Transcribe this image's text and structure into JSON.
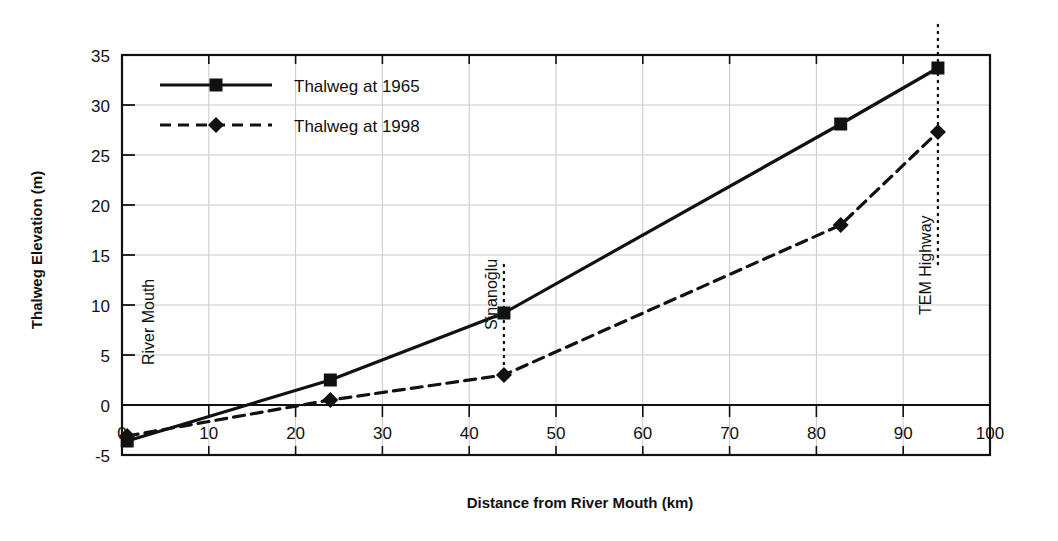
{
  "chart_data": {
    "type": "line",
    "title": "",
    "xlabel": "Distance from River Mouth (km)",
    "ylabel": "Thalweg Elevation (m)",
    "xlim": [
      0,
      100
    ],
    "ylim": [
      -5,
      35
    ],
    "xticks": [
      0,
      10,
      20,
      30,
      40,
      50,
      60,
      70,
      80,
      90,
      100
    ],
    "yticks": [
      -5,
      0,
      5,
      10,
      15,
      20,
      25,
      30,
      35
    ],
    "grid": "both",
    "legend_position": "top-left-inside",
    "series": [
      {
        "name": "Thalweg at 1965",
        "marker": "square",
        "line_style": "solid",
        "color": "#111111",
        "x": [
          0.6,
          24,
          44,
          82.8,
          94
        ],
        "y": [
          -3.6,
          2.5,
          9.2,
          28.1,
          33.7
        ]
      },
      {
        "name": "Thalweg at 1998",
        "marker": "diamond",
        "line_style": "dashed",
        "color": "#111111",
        "x": [
          0.6,
          24,
          44,
          82.8,
          94
        ],
        "y": [
          -3.1,
          0.5,
          3.0,
          18.0,
          27.3
        ]
      }
    ],
    "annotations": [
      {
        "label": "River Mouth",
        "x": 4.5,
        "orientation": "vertical",
        "marker_line": false
      },
      {
        "label": "Sinanoğlu",
        "x": 44,
        "orientation": "vertical",
        "marker_line": true,
        "line_top": 14.0,
        "line_bottom": 3.0
      },
      {
        "label": "TEM Highway",
        "x": 94,
        "orientation": "vertical",
        "marker_line": true,
        "line_top": 38.0,
        "line_bottom": 13.5
      }
    ]
  },
  "legend": {
    "entries": [
      {
        "label": "Thalweg at 1965"
      },
      {
        "label": "Thalweg at 1998"
      }
    ]
  },
  "axis_titles": {
    "x": "Distance from River Mouth (km)",
    "y": "Thalweg Elevation (m)"
  }
}
